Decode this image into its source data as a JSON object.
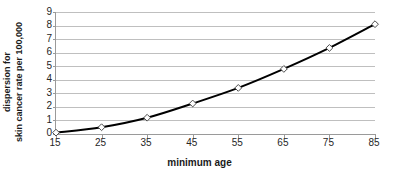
{
  "chart_data": {
    "type": "line",
    "title": "",
    "xlabel": "minimum age",
    "ylabel_lines": [
      "dispersion for",
      "skin cancer rate per 100,000"
    ],
    "ylabel": "dispersion for skin cancer rate per 100,000",
    "x": [
      15,
      25,
      35,
      45,
      55,
      65,
      75,
      85
    ],
    "xtick_labels": [
      "15",
      "25",
      "35",
      "45",
      "55",
      "65",
      "75",
      "85"
    ],
    "ytick_labels": [
      "9",
      "8",
      "7",
      "6",
      "5",
      "4",
      "3",
      "2",
      "1",
      "0"
    ],
    "values": [
      0.1,
      0.5,
      1.2,
      2.25,
      3.4,
      4.8,
      6.35,
      8.1
    ],
    "xlim": [
      15,
      85
    ],
    "ylim": [
      0,
      9
    ],
    "grid": "horizontal",
    "legend": "none",
    "marker": "diamond",
    "line_color": "#000000",
    "grid_color": "#bfbfbf",
    "axis_color": "#9a9a9a",
    "marker_fill": "#ffffff",
    "series": [
      {
        "name": "dispersion for skin cancer rate per 100,000",
        "values": [
          0.1,
          0.5,
          1.2,
          2.25,
          3.4,
          4.8,
          6.35,
          8.1
        ]
      }
    ]
  }
}
